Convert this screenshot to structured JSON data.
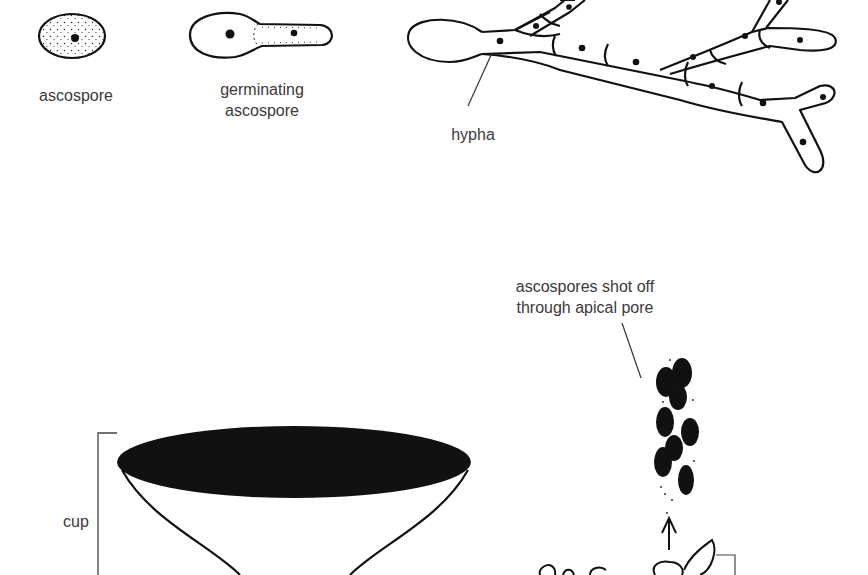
{
  "diagram": {
    "labels": {
      "ascospore": "ascospore",
      "germinating_line1": "germinating",
      "germinating_line2": "ascospore",
      "hypha": "hypha",
      "shot_line1": "ascospores shot off",
      "shot_line2": "through apical pore",
      "cup": "cup"
    },
    "colors": {
      "ink": "#111111",
      "label_text": "#3a3a3a",
      "background": "#ffffff"
    }
  }
}
